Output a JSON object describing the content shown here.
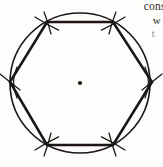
{
  "figure": {
    "background_color": "#fdfdfc",
    "ink_color": "#1a1715",
    "width": 163,
    "height": 167
  },
  "geometry": {
    "circle": {
      "center_x": 80,
      "center_y": 83,
      "radius": 70,
      "stroke_width": 1.6,
      "label": "circumscribed-circle"
    },
    "center_point": {
      "x": 80,
      "y": 83,
      "radius": 2.1,
      "label": "center-dot"
    },
    "hexagon": {
      "sides": 6,
      "stroke_width": 2.6,
      "vertices": [
        {
          "name": "top-left",
          "x": 47,
          "y": 22
        },
        {
          "name": "top-right",
          "x": 113,
          "y": 22
        },
        {
          "name": "right",
          "x": 152,
          "y": 82
        },
        {
          "name": "bottom-right",
          "x": 113,
          "y": 145
        },
        {
          "name": "bottom-left",
          "x": 47,
          "y": 145
        },
        {
          "name": "left",
          "x": 10,
          "y": 82
        }
      ]
    },
    "compass_arcs": [
      {
        "name": "arc-at-top-left",
        "cx": 47,
        "cy": 22,
        "rotation": -62
      },
      {
        "name": "arc-at-top-right",
        "cx": 113,
        "cy": 22,
        "rotation": 62
      },
      {
        "name": "arc-at-right",
        "cx": 152,
        "cy": 82,
        "rotation": 0
      },
      {
        "name": "arc-at-bottom-right",
        "cx": 113,
        "cy": 145,
        "rotation": -62
      },
      {
        "name": "arc-at-bottom-left",
        "cx": 47,
        "cy": 145,
        "rotation": 62
      },
      {
        "name": "arc-at-left",
        "cx": 10,
        "cy": 82,
        "rotation": 0
      }
    ]
  },
  "caption": {
    "line_1": "const",
    "line_2": "w",
    "line_3": "t"
  }
}
